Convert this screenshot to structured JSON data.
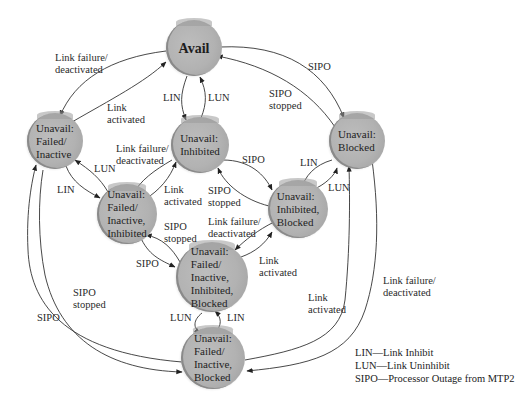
{
  "diagram": {
    "type": "state-diagram",
    "title": "",
    "nodes": [
      {
        "id": "avail",
        "label": "Avail"
      },
      {
        "id": "failed_inactive",
        "label": "Unavail:\nFailed/\nInactive"
      },
      {
        "id": "inhibited",
        "label": "Unavail:\nInhibited"
      },
      {
        "id": "blocked",
        "label": "Unavail:\nBlocked"
      },
      {
        "id": "failed_inactive_inhibited",
        "label": "Unavail:\nFailed/\nInactive,\nInhibited"
      },
      {
        "id": "inhibited_blocked",
        "label": "Unavail:\nInhibited,\nBlocked"
      },
      {
        "id": "failed_inactive_inhibited_blocked",
        "label": "Unavail:\nFailed/\nInactive,\nInhibited,\nBlocked"
      },
      {
        "id": "failed_inactive_blocked",
        "label": "Unavail:\nFailed/\nInactive,\nBlocked"
      }
    ],
    "edge_labels": {
      "avail_to_failed": "Link failure/\ndeactivated",
      "failed_to_avail": "Link\nactivated",
      "avail_to_inhibited": "LIN",
      "inhibited_to_avail": "LUN",
      "avail_to_blocked": "SIPO",
      "blocked_to_avail": "SIPO\nstopped",
      "inhibited_to_fii": "Link failure/\ndeactivated",
      "fii_to_inhibited": "Link\nactivated",
      "failed_to_fii": "LIN",
      "fii_to_failed": "LUN",
      "inhibited_to_ib": "SIPO",
      "ib_to_inhibited": "SIPO\nstopped",
      "blocked_to_ib": "LIN",
      "ib_to_blocked": "LUN",
      "fii_to_fiib": "SIPO",
      "fiib_to_fii": "SIPO\nstopped",
      "ib_to_fiib": "Link failure/\ndeactivated",
      "fiib_to_ib": "Link\nactivated",
      "fiib_to_fib": "LUN",
      "fib_to_fiib": "LIN",
      "failed_to_fib": "SIPO",
      "fib_to_failed": "SIPO\nstopped",
      "blocked_to_fib": "Link failure/\ndeactivated",
      "fib_to_blocked": "Link\nactivated"
    },
    "legend": [
      "LIN—Link Inhibit",
      "LUN—Link Uninhibit",
      "SIPO—Processor Outage from MTP2"
    ]
  }
}
